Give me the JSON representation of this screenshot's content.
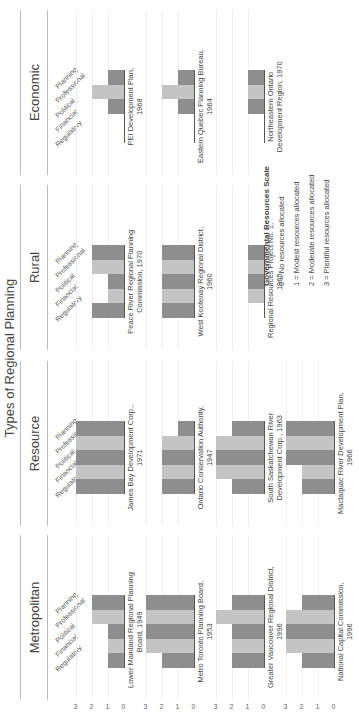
{
  "title": "Types of Regional Planning",
  "colors": {
    "dark": "#8e8e8e",
    "light": "#c4c4c4",
    "grid": "#eeeeee",
    "baseline": "#555555"
  },
  "categories": [
    "Regulatory",
    "Financial",
    "Political",
    "Professional",
    "Planning"
  ],
  "axis_ticks": [
    "3",
    "2",
    "1",
    "0"
  ],
  "sections": [
    {
      "name": "Metropolitan"
    },
    {
      "name": "Resource"
    },
    {
      "name": "Rural"
    },
    {
      "name": "Economic"
    }
  ],
  "legend": {
    "title": "Governmental Resources Scale",
    "items": [
      "0 = No resources allocated",
      "1 = Modest resources allocated",
      "2 = Moderate resources allocated",
      "3 = Plentiful resources allocated"
    ]
  },
  "chart_data": [
    {
      "type": "bar",
      "section": "Metropolitan",
      "title": "Lower Mainland Regional Planning Board, 1949",
      "title_lines": [
        "Lower Mainland Regional Planning",
        "Board, 1949"
      ],
      "categories": [
        "Regulatory",
        "Financial",
        "Political",
        "Professional",
        "Planning"
      ],
      "values": [
        1,
        1,
        1,
        2,
        2
      ],
      "ylim": [
        0,
        3
      ]
    },
    {
      "type": "bar",
      "section": "Metropolitan",
      "title": "Metro Toronto Planning Board, 1953",
      "title_lines": [
        "Metro Toronto Planning Board,",
        "1953"
      ],
      "categories": [
        "Regulatory",
        "Financial",
        "Political",
        "Professional",
        "Planning"
      ],
      "values": [
        2,
        3,
        3,
        3,
        3
      ],
      "ylim": [
        0,
        3
      ]
    },
    {
      "type": "bar",
      "section": "Metropolitan",
      "title": "Greater Vancouver Regional District, 1996",
      "title_lines": [
        "Greater Vancouver Regional District,",
        "1996"
      ],
      "categories": [
        "Regulatory",
        "Financial",
        "Political",
        "Professional",
        "Planning"
      ],
      "values": [
        2,
        2,
        2,
        3,
        2
      ],
      "ylim": [
        0,
        3
      ]
    },
    {
      "type": "bar",
      "section": "Metropolitan",
      "title": "National Capital Commission, 1996",
      "title_lines": [
        "National Capital Commission,",
        "1996"
      ],
      "categories": [
        "Regulatory",
        "Financial",
        "Political",
        "Professional",
        "Planning"
      ],
      "values": [
        2,
        3,
        3,
        3,
        2
      ],
      "ylim": [
        0,
        3
      ]
    },
    {
      "type": "bar",
      "section": "Resource",
      "title": "James Bay Development Corp., 1971",
      "title_lines": [
        "James Bay Development Corp.,",
        "1971"
      ],
      "categories": [
        "Regulatory",
        "Financial",
        "Political",
        "Professional",
        "Planning"
      ],
      "values": [
        3,
        3,
        3,
        3,
        3
      ],
      "ylim": [
        0,
        3
      ]
    },
    {
      "type": "bar",
      "section": "Resource",
      "title": "Ontario Conservation Authority, 1947",
      "title_lines": [
        "Ontario Conservation Authority,",
        "1947"
      ],
      "categories": [
        "Regulatory",
        "Financial",
        "Political",
        "Professional",
        "Planning"
      ],
      "values": [
        2,
        2,
        2,
        2,
        1
      ],
      "ylim": [
        0,
        3
      ]
    },
    {
      "type": "bar",
      "section": "Resource",
      "title": "South Saskatchewan River Development Corp., 1963",
      "title_lines": [
        "South Saskatchewan River",
        "Development Corp., 1963"
      ],
      "categories": [
        "Regulatory",
        "Financial",
        "Political",
        "Professional",
        "Planning"
      ],
      "values": [
        2,
        3,
        3,
        3,
        2
      ],
      "ylim": [
        0,
        3
      ]
    },
    {
      "type": "bar",
      "section": "Resource",
      "title": "Mactaquac River Development Plan, 1966",
      "title_lines": [
        "Mactaquac River Development Plan,",
        "1966"
      ],
      "categories": [
        "Regulatory",
        "Financial",
        "Political",
        "Professional",
        "Planning"
      ],
      "values": [
        2,
        2,
        3,
        3,
        3
      ],
      "ylim": [
        0,
        3
      ]
    },
    {
      "type": "bar",
      "section": "Rural",
      "title": "Peace River Regional Planning Commission, 1970",
      "title_lines": [
        "Peace River Regional Planning",
        "Commission, 1970"
      ],
      "categories": [
        "Regulatory",
        "Financial",
        "Political",
        "Professional",
        "Planning"
      ],
      "values": [
        2,
        1,
        1,
        2,
        2
      ],
      "ylim": [
        0,
        3
      ]
    },
    {
      "type": "bar",
      "section": "Rural",
      "title": "West Kootenay Regional District, 1960",
      "title_lines": [
        "West Kootenay Regional District,",
        "1960"
      ],
      "categories": [
        "Regulatory",
        "Financial",
        "Political",
        "Professional",
        "Planning"
      ],
      "values": [
        2,
        2,
        2,
        2,
        2
      ],
      "ylim": [
        0,
        3
      ]
    },
    {
      "type": "bar",
      "section": "Rural",
      "title": "Regional Resources Project No. 1, 1965",
      "title_lines": [
        "Regional Resources Project No. 1,",
        "1965"
      ],
      "categories": [
        "Regulatory",
        "Financial",
        "Political",
        "Professional",
        "Planning"
      ],
      "values": [
        0,
        1,
        1,
        1,
        1
      ],
      "ylim": [
        0,
        3
      ]
    },
    {
      "type": "bar",
      "section": "Economic",
      "title": "PEI Development Plan, 1968",
      "title_lines": [
        "PEI Development Plan,",
        "1968"
      ],
      "categories": [
        "Regulatory",
        "Financial",
        "Political",
        "Professional",
        "Planning"
      ],
      "values": [
        0,
        0,
        1,
        2,
        1
      ],
      "ylim": [
        0,
        3
      ]
    },
    {
      "type": "bar",
      "section": "Economic",
      "title": "Eastern Quebec Planning Bureau, 1964",
      "title_lines": [
        "Eastern Quebec Planning Bureau,",
        "1964"
      ],
      "categories": [
        "Regulatory",
        "Financial",
        "Political",
        "Professional",
        "Planning"
      ],
      "values": [
        0,
        0,
        1,
        2,
        1
      ],
      "ylim": [
        0,
        3
      ]
    },
    {
      "type": "bar",
      "section": "Economic",
      "title": "Northeastern Ontario Development Region, 1970",
      "title_lines": [
        "Northeastern Ontario",
        "Development Region, 1970"
      ],
      "categories": [
        "Regulatory",
        "Financial",
        "Political",
        "Professional",
        "Planning"
      ],
      "values": [
        0,
        0,
        1,
        1,
        1
      ],
      "ylim": [
        0,
        3
      ]
    }
  ]
}
